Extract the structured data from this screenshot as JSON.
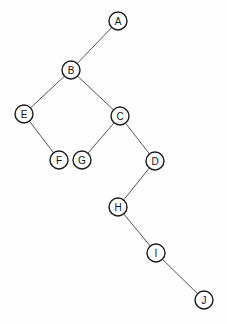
{
  "diagram": {
    "type": "node-link-tree",
    "canvas": {
      "width": 227,
      "height": 324,
      "background_color": "#fefefe"
    },
    "style": {
      "node_radius": 9,
      "node_fill": "#ffffff",
      "node_stroke": "#1a1a1a",
      "node_stroke_width": 1.4,
      "edge_color": "#555555",
      "edge_width": 1,
      "label_color": "#111111",
      "label_font_size": 10
    },
    "nodes": [
      {
        "id": "A",
        "label": "A",
        "x": 118,
        "y": 21
      },
      {
        "id": "B",
        "label": "B",
        "x": 71,
        "y": 70
      },
      {
        "id": "E",
        "label": "E",
        "x": 24,
        "y": 114
      },
      {
        "id": "C",
        "label": "C",
        "x": 120,
        "y": 116
      },
      {
        "id": "F",
        "label": "F",
        "x": 59,
        "y": 160
      },
      {
        "id": "G",
        "label": "G",
        "x": 82,
        "y": 160
      },
      {
        "id": "D",
        "label": "D",
        "x": 155,
        "y": 161
      },
      {
        "id": "H",
        "label": "H",
        "x": 118,
        "y": 207
      },
      {
        "id": "I",
        "label": "I",
        "x": 156,
        "y": 253
      },
      {
        "id": "J",
        "label": "J",
        "x": 204,
        "y": 300
      }
    ],
    "edges": [
      {
        "from": "A",
        "to": "B"
      },
      {
        "from": "B",
        "to": "E"
      },
      {
        "from": "B",
        "to": "C"
      },
      {
        "from": "E",
        "to": "F"
      },
      {
        "from": "C",
        "to": "G"
      },
      {
        "from": "C",
        "to": "D"
      },
      {
        "from": "D",
        "to": "H"
      },
      {
        "from": "H",
        "to": "I"
      },
      {
        "from": "I",
        "to": "J"
      }
    ]
  }
}
